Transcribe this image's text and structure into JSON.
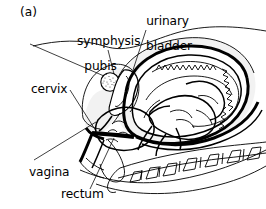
{
  "figure": {
    "panel_letter": "(a)",
    "caption_present": false,
    "background_color": "#ffffff",
    "line_color": "#000000",
    "shading_color": "#ebebeb"
  },
  "labels": [
    {
      "id": "symphysis-pubis",
      "text_line1": "symphysis",
      "text_line2": "pubis",
      "x": 65,
      "y": 22,
      "align": "center"
    },
    {
      "id": "urinary-bladder",
      "text_line1": "urinary",
      "text_line2": "bladder",
      "x": 134,
      "y": 2,
      "align": "center"
    },
    {
      "id": "cervix",
      "text_line1": "cervix",
      "text_line2": "",
      "x": 31,
      "y": 82,
      "align": "left"
    },
    {
      "id": "vagina",
      "text_line1": "vagina",
      "text_line2": "",
      "x": 29,
      "y": 166,
      "align": "left"
    },
    {
      "id": "rectum",
      "text_line1": "rectum",
      "text_line2": "",
      "x": 61,
      "y": 188,
      "align": "left"
    }
  ],
  "structures": [
    {
      "id": "abdominal-wall",
      "name": "anterior abdominal wall"
    },
    {
      "id": "uterus-wall",
      "name": "uterine wall"
    },
    {
      "id": "placenta",
      "name": "placenta with serrated margin"
    },
    {
      "id": "fetus",
      "name": "fetus in vertex presentation"
    },
    {
      "id": "fetal-head",
      "name": "fetal head engaged in pelvis"
    },
    {
      "id": "symphysis-pubis",
      "name": "symphysis pubis (stippled)"
    },
    {
      "id": "urinary-bladder",
      "name": "urinary bladder"
    },
    {
      "id": "cervix",
      "name": "cervix"
    },
    {
      "id": "vagina",
      "name": "vagina"
    },
    {
      "id": "rectum",
      "name": "rectum"
    },
    {
      "id": "sacrum-coccyx",
      "name": "sacrum and coccyx"
    },
    {
      "id": "lumbar-spine",
      "name": "lumbar vertebrae with spinous processes"
    }
  ]
}
